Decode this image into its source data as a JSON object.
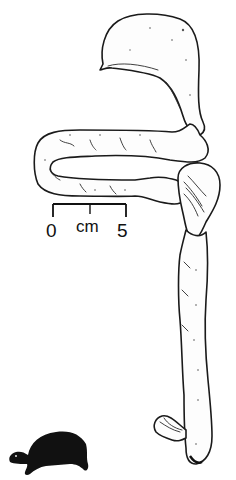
{
  "figure": {
    "style": "black and white line drawing",
    "background_color": "#ffffff",
    "line_color": "#1a1a1a"
  },
  "parts": [
    {
      "name": "stomach",
      "label": ""
    },
    {
      "name": "small-intestine",
      "label": ""
    },
    {
      "name": "caecum",
      "label": ""
    },
    {
      "name": "large-intestine",
      "label": ""
    },
    {
      "name": "cloaca",
      "label": ""
    }
  ],
  "scale_bar": {
    "min_label": "0",
    "unit_label": "cm",
    "max_label": "5"
  },
  "silhouette": {
    "name": "turtle-silhouette",
    "color": "#111111"
  }
}
